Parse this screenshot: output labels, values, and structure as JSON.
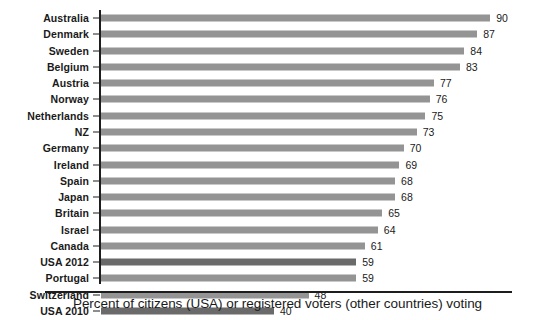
{
  "chart_data": {
    "type": "bar",
    "orientation": "horizontal",
    "title": "",
    "subtitle": "",
    "xlabel": "Percent of citizens (USA) or registered voters (other countries) voting",
    "ylabel": "",
    "xlim": [
      0,
      90
    ],
    "grid": false,
    "legend": [],
    "categories": [
      "Australia",
      "Denmark",
      "Sweden",
      "Belgium",
      "Austria",
      "Norway",
      "Netherlands",
      "NZ",
      "Germany",
      "Ireland",
      "Spain",
      "Japan",
      "Britain",
      "Israel",
      "Canada",
      "USA 2012",
      "Portugal",
      "Switzerland",
      "USA 2010"
    ],
    "values": [
      90,
      87,
      84,
      83,
      77,
      76,
      75,
      73,
      70,
      69,
      68,
      68,
      65,
      64,
      61,
      59,
      59,
      48,
      40
    ],
    "value_labels": [
      "90",
      "87",
      "84",
      "83",
      "77",
      "76",
      "75",
      "73",
      "70",
      "69",
      "68",
      "68",
      "65",
      "64",
      "61",
      "59",
      "59",
      "48",
      "40"
    ],
    "highlighted": [
      "USA 2012",
      "USA 2010"
    ],
    "colors": {
      "bar": "#949494",
      "bar_highlight": "#6a6a6a",
      "axis": "#1d1d1d",
      "text": "#1a1a1a",
      "background": "#ffffff"
    }
  },
  "caption": {
    "text": "Percent of citizens (USA) or registered voters (other countries) voting"
  }
}
